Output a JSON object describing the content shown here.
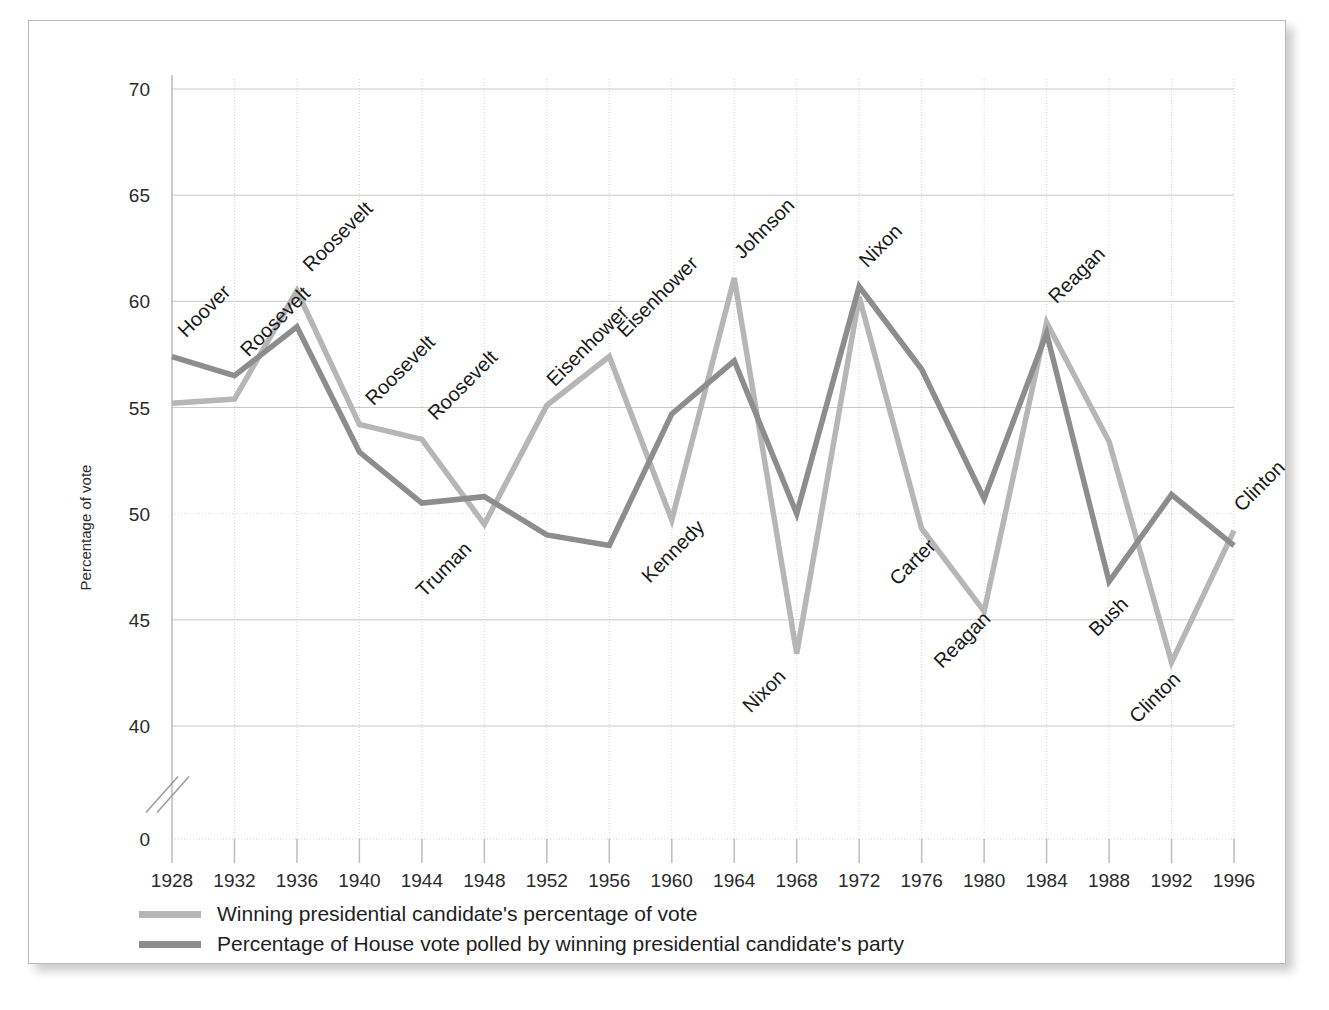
{
  "chart_data": {
    "type": "line",
    "title": "",
    "xlabel": "",
    "ylabel": "Percentage of vote",
    "x": [
      1928,
      1932,
      1936,
      1940,
      1944,
      1948,
      1952,
      1956,
      1960,
      1964,
      1968,
      1972,
      1976,
      1980,
      1984,
      1988,
      1992,
      1996
    ],
    "categories": [
      "1928",
      "1932",
      "1936",
      "1940",
      "1944",
      "1948",
      "1952",
      "1956",
      "1960",
      "1964",
      "1968",
      "1972",
      "1976",
      "1980",
      "1984",
      "1988",
      "1992",
      "1996"
    ],
    "xlim": [
      1928,
      1996
    ],
    "ylim": [
      40,
      70
    ],
    "y_ticks": [
      "0",
      "40",
      "45",
      "50",
      "55",
      "60",
      "65",
      "70"
    ],
    "y_tick_values": [
      0,
      40,
      45,
      50,
      55,
      60,
      65,
      70
    ],
    "axis_break": true,
    "grid": true,
    "legend_position": "below-axis-left",
    "series": [
      {
        "name": "Winning presidential candidate's percentage of vote",
        "color": "#b6b6b6",
        "values": [
          55.2,
          55.4,
          60.5,
          54.2,
          53.5,
          49.5,
          55.1,
          57.4,
          49.7,
          61.1,
          43.4,
          60.2,
          49.3,
          45.4,
          59.0,
          53.4,
          43.0,
          49.2
        ]
      },
      {
        "name": "Percentage of House vote polled by winning presidential candidate's party",
        "color": "#8d8d8d",
        "values": [
          57.4,
          56.5,
          58.8,
          52.9,
          50.5,
          50.8,
          49.0,
          48.5,
          54.7,
          57.2,
          50.0,
          60.7,
          56.8,
          50.7,
          58.5,
          46.8,
          50.9,
          48.5
        ]
      }
    ],
    "annotations": [
      {
        "text": "Hoover",
        "x": 1928,
        "y": 57.4,
        "dx": 14,
        "dy": -18
      },
      {
        "text": "Roosevelt",
        "x": 1932,
        "y": 56.5,
        "dx": 14,
        "dy": -18
      },
      {
        "text": "Roosevelt",
        "x": 1936,
        "y": 60.5,
        "dx": 14,
        "dy": -18
      },
      {
        "text": "Roosevelt",
        "x": 1940,
        "y": 54.2,
        "dx": 14,
        "dy": -18
      },
      {
        "text": "Roosevelt",
        "x": 1944,
        "y": 53.5,
        "dx": 14,
        "dy": -18
      },
      {
        "text": "Truman",
        "x": 1948,
        "y": 49.5,
        "dx": -60,
        "dy": 74
      },
      {
        "text": "Eisenhower",
        "x": 1952,
        "y": 55.1,
        "dx": 8,
        "dy": -18
      },
      {
        "text": "Eisenhower",
        "x": 1956,
        "y": 57.4,
        "dx": 16,
        "dy": -18
      },
      {
        "text": "Kennedy",
        "x": 1960,
        "y": 49.7,
        "dx": -22,
        "dy": 64
      },
      {
        "text": "Johnson",
        "x": 1964,
        "y": 61.1,
        "dx": 8,
        "dy": -18
      },
      {
        "text": "Nixon",
        "x": 1968,
        "y": 43.4,
        "dx": -46,
        "dy": 60
      },
      {
        "text": "Nixon",
        "x": 1972,
        "y": 60.7,
        "dx": 8,
        "dy": -18
      },
      {
        "text": "Carter",
        "x": 1976,
        "y": 49.3,
        "dx": -24,
        "dy": 58
      },
      {
        "text": "Reagan",
        "x": 1980,
        "y": 45.4,
        "dx": -42,
        "dy": 58
      },
      {
        "text": "Reagan",
        "x": 1984,
        "y": 59.0,
        "dx": 10,
        "dy": -18
      },
      {
        "text": "Bush",
        "x": 1988,
        "y": 46.8,
        "dx": -12,
        "dy": 56
      },
      {
        "text": "Clinton",
        "x": 1992,
        "y": 43.0,
        "dx": -34,
        "dy": 62
      },
      {
        "text": "Clinton",
        "x": 1996,
        "y": 49.2,
        "dx": 8,
        "dy": -18
      }
    ]
  },
  "legend": {
    "items": [
      {
        "label": "Winning presidential candidate's percentage of vote",
        "color": "#b6b6b6"
      },
      {
        "label": "Percentage of House vote polled by winning presidential candidate's party",
        "color": "#8d8d8d"
      }
    ]
  }
}
